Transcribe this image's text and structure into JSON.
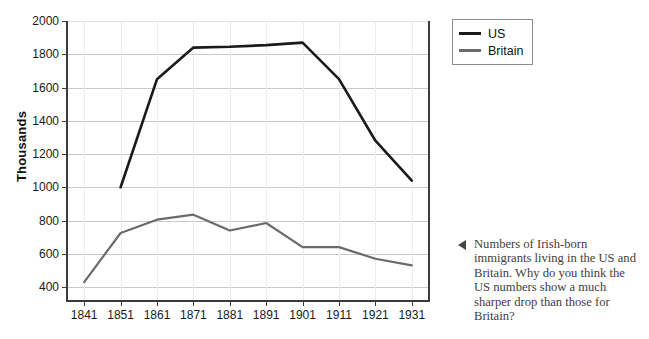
{
  "chart_data": {
    "type": "line",
    "title": "",
    "xlabel": "",
    "ylabel": "Thousands",
    "categories": [
      "1841",
      "1851",
      "1861",
      "1871",
      "1881",
      "1891",
      "1901",
      "1911",
      "1921",
      "1931"
    ],
    "x": [
      1841,
      1851,
      1861,
      1871,
      1881,
      1891,
      1901,
      1911,
      1921,
      1931
    ],
    "xlim": [
      1836,
      1936
    ],
    "ylim": [
      310,
      2000
    ],
    "yticks": [
      400,
      600,
      800,
      1000,
      1200,
      1400,
      1600,
      1800,
      2000
    ],
    "grid": "horizontal-and-vertical",
    "legend_position": "top-right-outside",
    "series": [
      {
        "name": "US",
        "color": "#1a1a1a",
        "x": [
          1851,
          1861,
          1871,
          1881,
          1891,
          1901,
          1911,
          1921,
          1931
        ],
        "values": [
          1000,
          1650,
          1840,
          1845,
          1855,
          1870,
          1650,
          1280,
          1040
        ]
      },
      {
        "name": "Britain",
        "color": "#6b6b6b",
        "x": [
          1841,
          1851,
          1861,
          1871,
          1881,
          1891,
          1901,
          1911,
          1921,
          1931
        ],
        "values": [
          430,
          725,
          805,
          835,
          740,
          785,
          640,
          640,
          570,
          530
        ]
      }
    ]
  },
  "legend": {
    "items": [
      {
        "label": "US",
        "color": "#1a1a1a"
      },
      {
        "label": "Britain",
        "color": "#6b6b6b"
      }
    ]
  },
  "caption": {
    "marker": "left-triangle",
    "text": "Numbers of Irish-born immigrants living in the US and Britain. Why do you think the US numbers show a much sharper drop than those for Britain?"
  }
}
